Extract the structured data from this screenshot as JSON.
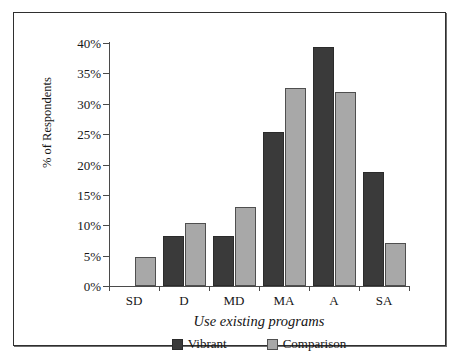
{
  "chart_data": {
    "type": "bar",
    "title": "",
    "subtitle": "",
    "xlabel": "Use existing programs",
    "ylabel": "% of Respondents",
    "categories": [
      "SD",
      "D",
      "MD",
      "MA",
      "A",
      "SA"
    ],
    "series": [
      {
        "name": "Vibrant",
        "color": "#3a3a3a",
        "values": [
          0,
          8.2,
          8.2,
          25.4,
          39.3,
          18.8
        ]
      },
      {
        "name": "Comparison",
        "color": "#a8a8a8",
        "values": [
          4.7,
          10.4,
          13.0,
          32.6,
          31.9,
          7.1
        ]
      }
    ],
    "ylim": [
      0,
      40
    ],
    "ytick_values": [
      0,
      5,
      10,
      15,
      20,
      25,
      30,
      35,
      40
    ],
    "ytick_labels": [
      "0%",
      "5%",
      "10%",
      "15%",
      "20%",
      "25%",
      "30%",
      "35%",
      "40%"
    ],
    "grid": false,
    "legend_position": "bottom-center",
    "axis_color": "#4a4a4a",
    "frame_color": "#2f2f2f"
  },
  "legend": {
    "items": [
      {
        "label": "Vibrant",
        "swatch": "legend-swatch-vibrant"
      },
      {
        "label": "Comparison",
        "swatch": "legend-swatch-comparison"
      }
    ]
  }
}
